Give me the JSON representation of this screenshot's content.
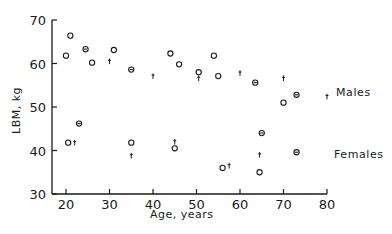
{
  "chart_data": {
    "type": "scatter",
    "title": "",
    "xlabel": "Age, years",
    "ylabel": "LBM, kg",
    "xlim": [
      17,
      80
    ],
    "ylim": [
      30,
      70
    ],
    "xticks": [
      20,
      30,
      40,
      50,
      60,
      70,
      80
    ],
    "yticks": [
      30,
      40,
      50,
      60,
      70
    ],
    "grid": false,
    "legend": "inline labels at right",
    "marker_legend": {
      "circle": "open circle",
      "circle-dot": "circle with dot",
      "cross": "small cross / dagger"
    },
    "series": [
      {
        "name": "Males",
        "label_position": {
          "age": 82,
          "lbm": 53.3
        },
        "points": [
          {
            "x": 20,
            "y": 61.8,
            "marker": "circle"
          },
          {
            "x": 21,
            "y": 66.4,
            "marker": "circle"
          },
          {
            "x": 24.5,
            "y": 63.3,
            "marker": "circle-dot"
          },
          {
            "x": 26,
            "y": 60.2,
            "marker": "circle"
          },
          {
            "x": 30,
            "y": 60.5,
            "marker": "cross"
          },
          {
            "x": 31,
            "y": 63.1,
            "marker": "circle"
          },
          {
            "x": 35,
            "y": 58.6,
            "marker": "circle-dot"
          },
          {
            "x": 40,
            "y": 57.1,
            "marker": "cross"
          },
          {
            "x": 44,
            "y": 62.3,
            "marker": "circle"
          },
          {
            "x": 46,
            "y": 59.8,
            "marker": "circle"
          },
          {
            "x": 50.5,
            "y": 58.0,
            "marker": "circle"
          },
          {
            "x": 50.5,
            "y": 56.6,
            "marker": "cross"
          },
          {
            "x": 54,
            "y": 61.8,
            "marker": "circle"
          },
          {
            "x": 55,
            "y": 57.1,
            "marker": "circle"
          },
          {
            "x": 60,
            "y": 57.8,
            "marker": "cross"
          },
          {
            "x": 63.5,
            "y": 55.6,
            "marker": "circle-dot"
          },
          {
            "x": 70,
            "y": 56.6,
            "marker": "cross"
          },
          {
            "x": 70,
            "y": 51.0,
            "marker": "circle"
          },
          {
            "x": 73,
            "y": 52.8,
            "marker": "circle-dot"
          },
          {
            "x": 80,
            "y": 52.4,
            "marker": "cross"
          }
        ]
      },
      {
        "name": "Females",
        "label_position": {
          "age": 81.5,
          "lbm": 39.2
        },
        "points": [
          {
            "x": 20.5,
            "y": 41.8,
            "marker": "circle"
          },
          {
            "x": 22,
            "y": 41.8,
            "marker": "cross"
          },
          {
            "x": 23,
            "y": 46.2,
            "marker": "circle-dot"
          },
          {
            "x": 35,
            "y": 41.8,
            "marker": "circle"
          },
          {
            "x": 35,
            "y": 38.8,
            "marker": "cross"
          },
          {
            "x": 45,
            "y": 42.0,
            "marker": "cross"
          },
          {
            "x": 45,
            "y": 40.5,
            "marker": "circle"
          },
          {
            "x": 56,
            "y": 36.0,
            "marker": "circle"
          },
          {
            "x": 57.5,
            "y": 36.5,
            "marker": "cross"
          },
          {
            "x": 64.5,
            "y": 39.0,
            "marker": "cross"
          },
          {
            "x": 64.5,
            "y": 35.0,
            "marker": "circle"
          },
          {
            "x": 65,
            "y": 44.0,
            "marker": "circle-dot"
          },
          {
            "x": 73,
            "y": 39.6,
            "marker": "circle-dot"
          }
        ]
      }
    ]
  },
  "colors": {
    "ink": "#1a1a1a",
    "background": "#ffffff"
  }
}
